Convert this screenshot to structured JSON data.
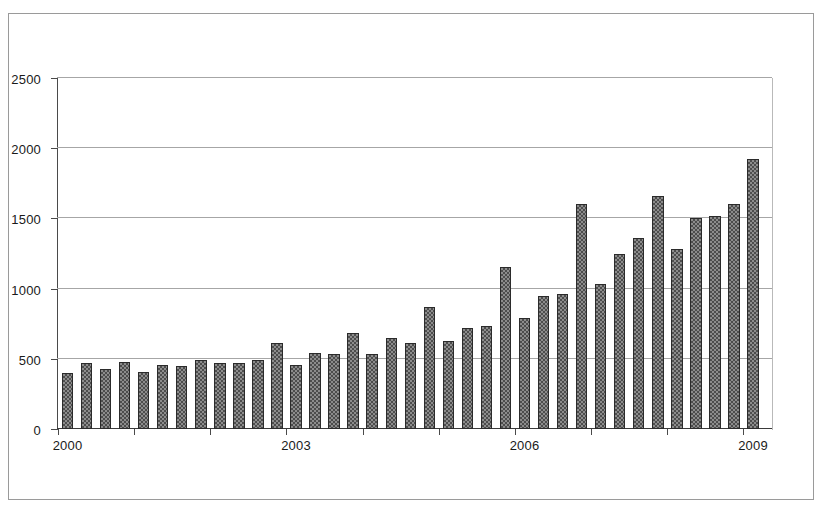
{
  "chart_data": {
    "type": "bar",
    "title": "",
    "subtitle": "",
    "xlabel": "",
    "ylabel": "",
    "ylim": [
      0,
      2500
    ],
    "y_ticks": [
      0,
      500,
      1000,
      1500,
      2000,
      2500
    ],
    "y_tick_labels": [
      "0",
      "500",
      "1000",
      "1500",
      "2000",
      "2500"
    ],
    "grid": "horizontal",
    "legend": "none",
    "x_tick_labels": [
      "2000",
      "2003",
      "2006",
      "2009"
    ],
    "x_tick_categories": [
      "2000 Q1",
      "2003 Q1",
      "2006 Q1",
      "2009 Q1"
    ],
    "bar_fill_color": "#8c8c8c",
    "bar_pattern": "checkerboard-hatch",
    "bar_edge_color": "#2b2b2b",
    "gridline_color": "#a6a6a6",
    "axis_color": "#4a4a4a",
    "frame_color": "#9a9a9a",
    "background_color": "#ffffff",
    "categories": [
      "2000 Q1",
      "2000 Q2",
      "2000 Q3",
      "2000 Q4",
      "2001 Q1",
      "2001 Q2",
      "2001 Q3",
      "2001 Q4",
      "2002 Q1",
      "2002 Q2",
      "2002 Q3",
      "2002 Q4",
      "2003 Q1",
      "2003 Q2",
      "2003 Q3",
      "2003 Q4",
      "2004 Q1",
      "2004 Q2",
      "2004 Q3",
      "2004 Q4",
      "2005 Q1",
      "2005 Q2",
      "2005 Q3",
      "2005 Q4",
      "2006 Q1",
      "2006 Q2",
      "2006 Q3",
      "2006 Q4",
      "2007 Q1",
      "2007 Q2",
      "2007 Q3",
      "2007 Q4",
      "2008 Q1",
      "2008 Q2",
      "2008 Q3",
      "2008 Q4",
      "2009 Q1"
    ],
    "values": [
      400,
      470,
      425,
      480,
      405,
      455,
      450,
      495,
      470,
      470,
      490,
      615,
      455,
      540,
      535,
      685,
      535,
      645,
      610,
      870,
      625,
      720,
      735,
      1155,
      790,
      945,
      965,
      1605,
      1030,
      1250,
      1360,
      1660,
      1285,
      1500,
      1520,
      1600,
      1920
    ]
  }
}
